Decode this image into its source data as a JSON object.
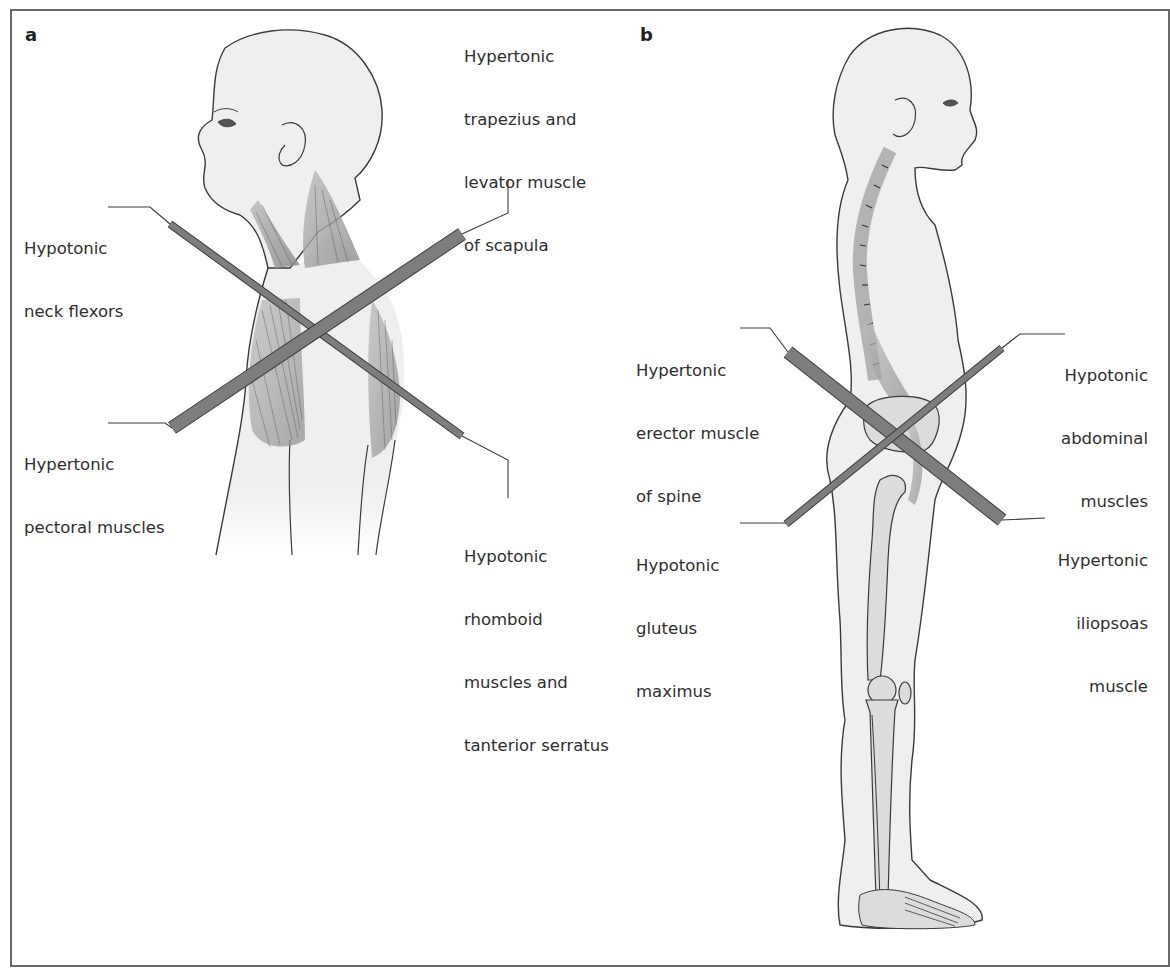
{
  "figure": {
    "panels": [
      {
        "letter": "a",
        "view": "upper body, left lateral view",
        "labels": {
          "neck_flexors": [
            "Hypotonic",
            "neck flexors"
          ],
          "trapezius": [
            "Hypertonic",
            "trapezius and",
            "levator muscle",
            "of scapula"
          ],
          "pectoral": [
            "Hypertonic",
            "pectoral muscles"
          ],
          "rhomboid": [
            "Hypotonic",
            "rhomboid",
            "muscles and",
            "tanterior serratus"
          ]
        }
      },
      {
        "letter": "b",
        "view": "full body, right lateral view with skeleton",
        "labels": {
          "erector": [
            "Hypertonic",
            "erector muscle",
            "of spine"
          ],
          "abdominal": [
            "Hypotonic",
            "abdominal",
            "muscles"
          ],
          "gluteus": [
            "Hypotonic",
            "gluteus",
            "maximus"
          ],
          "iliopsoas": [
            "Hypertonic",
            "iliopsoas",
            "muscle"
          ]
        }
      }
    ],
    "colors": {
      "frame": "#6a6a6a",
      "bar_fill": "#7d7d7d",
      "bar_stroke": "#3c3c3c",
      "skin": "#efefef",
      "outline": "#3a3a3a",
      "muscle": "#9a9a9a",
      "bone": "#dcdcdc"
    }
  }
}
